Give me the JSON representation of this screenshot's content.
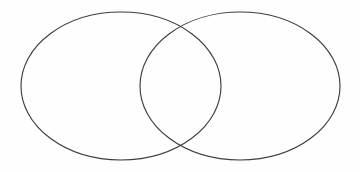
{
  "figure": {
    "type": "venn-diagram",
    "title": "",
    "caption": "",
    "background_color": "#fefefe",
    "stroke_color": "#3d3d3d",
    "stroke_width": 1.15,
    "fill": "none",
    "canvas": {
      "width": 360,
      "height": 172
    }
  },
  "chart_data": {
    "type": "diagram",
    "subtype": "venn-2-set",
    "title": "",
    "xlabel": "",
    "ylabel": "",
    "grid": false,
    "legend": "none",
    "labels_shown": false,
    "annotations": [],
    "sets": [
      {
        "name": "left-set",
        "label": "",
        "shape": "ellipse",
        "cx": 121,
        "cy": 86,
        "rx": 100,
        "ry": 74,
        "fill": "none",
        "stroke": "#3d3d3d"
      },
      {
        "name": "right-set",
        "label": "",
        "shape": "ellipse",
        "cx": 240,
        "cy": 86,
        "rx": 100,
        "ry": 74,
        "fill": "none",
        "stroke": "#3d3d3d"
      }
    ],
    "regions": [
      {
        "name": "left-only",
        "label": "",
        "value": null
      },
      {
        "name": "intersection",
        "label": "",
        "value": null
      },
      {
        "name": "right-only",
        "label": "",
        "value": null
      }
    ],
    "intersection_points": [
      {
        "x": 180,
        "y": 28
      },
      {
        "x": 180,
        "y": 145
      }
    ],
    "extents": {
      "left_edge_x": 21,
      "right_edge_x": 340,
      "top_edge_y": 12,
      "bottom_edge_y": 160
    }
  }
}
